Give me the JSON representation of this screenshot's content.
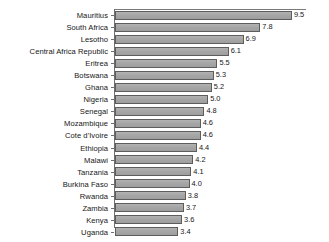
{
  "chart_data": {
    "type": "bar",
    "orientation": "horizontal",
    "title": "",
    "subtitle": "",
    "xlabel": "",
    "ylabel": "",
    "xlim": [
      0,
      10.2
    ],
    "grid": false,
    "legend": null,
    "bar_color": "#a9a9a9",
    "bar_edge_color": "#5d5d5d",
    "background_color": "#ffffff",
    "axis_color": "#6e6e6e",
    "value_label_format": "one-decimal",
    "categories": [
      "Mauritius",
      "South Africa",
      "Lesotho",
      "Central Africa Republic",
      "Eritrea",
      "Botswana",
      "Ghana",
      "Nigeria",
      "Senegal",
      "Mozambique",
      "Cote d'Ivoire",
      "Ethiopia",
      "Malawi",
      "Tanzania",
      "Burkina Faso",
      "Rwanda",
      "Zambia",
      "Kenya",
      "Uganda"
    ],
    "values": [
      9.5,
      7.8,
      6.9,
      6.1,
      5.5,
      5.3,
      5.2,
      5.0,
      4.8,
      4.6,
      4.6,
      4.4,
      4.2,
      4.1,
      4.0,
      3.8,
      3.7,
      3.6,
      3.4
    ],
    "value_labels": [
      "9.5",
      "7.8",
      "6.9",
      "6.1",
      "5.5",
      "5.3",
      "5.2",
      "5.0",
      "4.8",
      "4.6",
      "4.6",
      "4.4",
      "4.2",
      "4.1",
      "4.0",
      "3.8",
      "3.7",
      "3.6",
      "3.4"
    ]
  }
}
